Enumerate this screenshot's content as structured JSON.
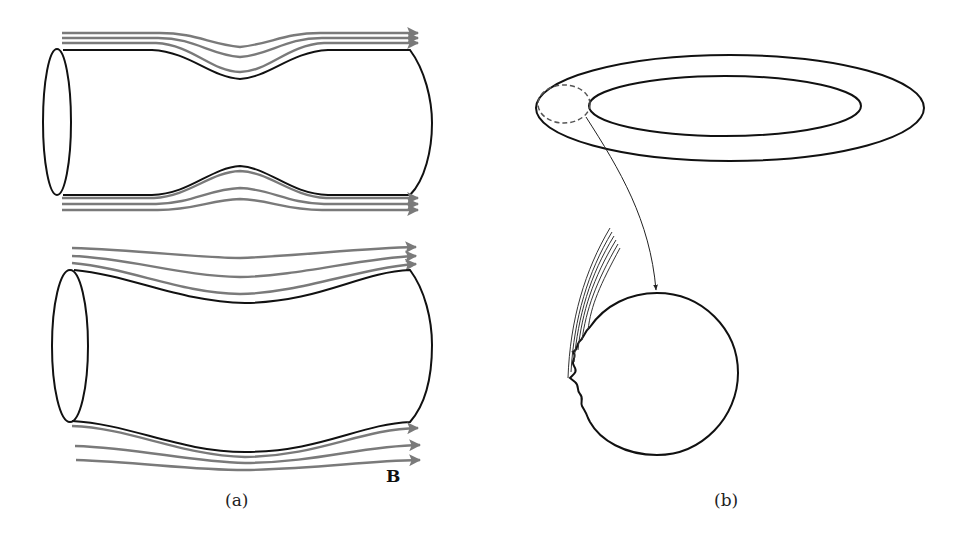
{
  "figure": {
    "panel_a": {
      "label": "(a)",
      "field_label": "B",
      "top_mode": "sausage (m=0) instability: flux tube pinched, field lines compressed at neck",
      "bottom_mode": "kink (m=1) instability: flux tube bent, field lines follow the bend"
    },
    "panel_b": {
      "label": "(b)",
      "description": "Torus (tokamak) with dashed cross-section circle; arrow points to enlarged cross-section showing rippled edge with peeling filaments"
    },
    "colors": {
      "outline": "#111111",
      "field_line": "#7a7a7a",
      "background": "#ffffff"
    }
  }
}
